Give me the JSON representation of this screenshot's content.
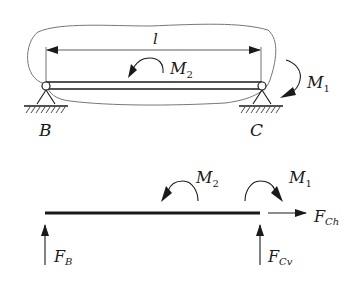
{
  "diagram": {
    "type": "beam free-body diagram",
    "top": {
      "length_label": "l",
      "moment_on_beam": {
        "symbol": "M",
        "subscript": "2",
        "direction": "counterclockwise"
      },
      "moment_at_C": {
        "symbol": "M",
        "subscript": "1",
        "direction": "clockwise"
      },
      "support_left": "B",
      "support_right": "C"
    },
    "bottom": {
      "M2": {
        "symbol": "M",
        "subscript": "2"
      },
      "M1": {
        "symbol": "M",
        "subscript": "1"
      },
      "F_Ch": {
        "symbol": "F",
        "subscript": "Ch"
      },
      "F_B": {
        "symbol": "F",
        "subscript": "B"
      },
      "F_Cv": {
        "symbol": "F",
        "subscript": "Cv"
      }
    }
  },
  "colors": {
    "ink": "#1a1a1a",
    "outline": "#6e6e6e"
  }
}
